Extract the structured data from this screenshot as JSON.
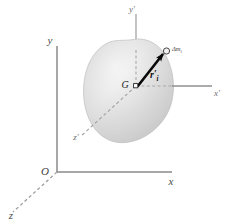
{
  "figure": {
    "kind": "mechanics-diagram",
    "background_color": "#ffffff"
  },
  "fixed_frame": {
    "name": "fixed-reference-frame",
    "origin_label": "O",
    "axes": [
      {
        "id": "y",
        "label": "y",
        "style": "solid",
        "direction": "up"
      },
      {
        "id": "x",
        "label": "x",
        "style": "solid",
        "direction": "right"
      },
      {
        "id": "z",
        "label": "z",
        "style": "dashed",
        "direction": "down-left"
      }
    ],
    "axis_color": "#8a8a8a",
    "label_color": "#4a4a4a"
  },
  "translating_frame": {
    "name": "centroidal-translating-frame",
    "origin_label": "G",
    "axes": [
      {
        "id": "y-prime",
        "label": "y",
        "prime": "′",
        "style": "solid",
        "direction": "up"
      },
      {
        "id": "x-prime",
        "label": "x",
        "prime": "′",
        "style": "solid",
        "direction": "right"
      },
      {
        "id": "z-prime",
        "label": "z",
        "prime": "′",
        "style": "dashed",
        "direction": "down-left"
      }
    ],
    "axis_color": "#9b9b9b",
    "label_color": "#6e6e6e"
  },
  "body": {
    "name": "rigid-body-blob",
    "fill_light": "#fafafa",
    "fill_mid": "#e2e2e2",
    "fill_dark": "#c9c9c9",
    "edge_color": "#b5b5b5"
  },
  "center_of_mass": {
    "label": "G",
    "marker": "square-dot"
  },
  "mass_element": {
    "label_delta": "Δ",
    "label_symbol": "m",
    "label_subscript": "i",
    "full_label": "Δm",
    "marker": "open-circle"
  },
  "position_vector": {
    "name": "position-vector-r-prime-i",
    "label_symbol": "r",
    "label_prime": "′",
    "label_subscript": "i",
    "color": "#080808",
    "style": "bold-arrow"
  }
}
